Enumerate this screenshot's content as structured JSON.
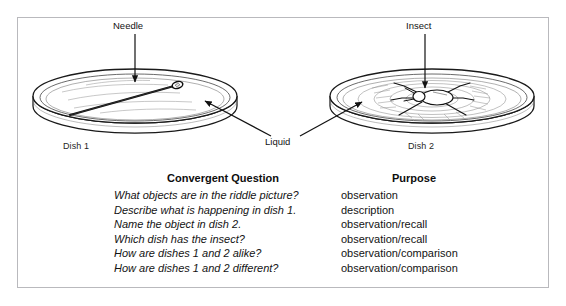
{
  "figure": {
    "labels": {
      "needle": "Needle",
      "insect": "Insect",
      "liquid": "Liquid",
      "dish1": "Dish 1",
      "dish2": "Dish 2"
    },
    "colors": {
      "frame_border": "#b9b9bd",
      "ink": "#131313",
      "background": "#ffffff"
    }
  },
  "table": {
    "headers": {
      "question": "Convergent Question",
      "purpose": "Purpose"
    },
    "rows": [
      {
        "question": "What objects are in the riddle picture?",
        "purpose": "observation"
      },
      {
        "question": "Describe what is happening in dish 1.",
        "purpose": "description"
      },
      {
        "question": "Name the object in dish 2.",
        "purpose": "observation/recall"
      },
      {
        "question": "Which dish has the insect?",
        "purpose": "observation/recall"
      },
      {
        "question": "How are dishes 1 and 2 alike?",
        "purpose": "observation/comparison"
      },
      {
        "question": "How are dishes 1 and 2 different?",
        "purpose": "observation/comparison"
      }
    ]
  }
}
